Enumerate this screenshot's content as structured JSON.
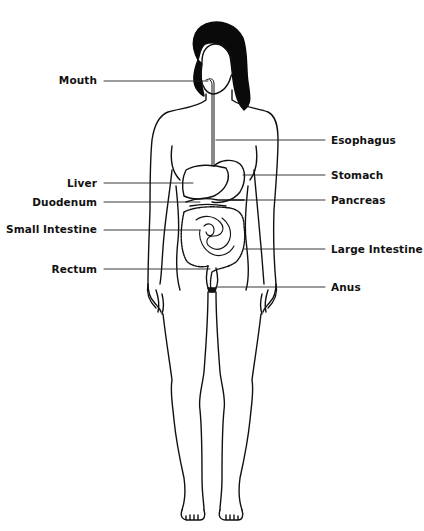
{
  "diagram": {
    "colors": {
      "line": "#111111",
      "hair": "#0a0a0a",
      "background": "#ffffff"
    },
    "labels_left": [
      {
        "id": "mouth",
        "text": "Mouth"
      },
      {
        "id": "liver",
        "text": "Liver"
      },
      {
        "id": "duodenum",
        "text": "Duodenum"
      },
      {
        "id": "small-intestine",
        "text": "Small Intestine"
      },
      {
        "id": "rectum",
        "text": "Rectum"
      }
    ],
    "labels_right": [
      {
        "id": "esophagus",
        "text": "Esophagus"
      },
      {
        "id": "stomach",
        "text": "Stomach"
      },
      {
        "id": "pancreas",
        "text": "Pancreas"
      },
      {
        "id": "large-intestine",
        "text": "Large Intestine"
      },
      {
        "id": "anus",
        "text": "Anus"
      }
    ]
  }
}
